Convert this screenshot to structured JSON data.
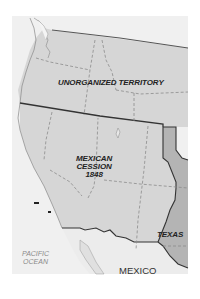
{
  "map": {
    "labels": {
      "unorganized": "UNORGANIZED TERRITORY",
      "cession_line1": "MEXICAN",
      "cession_line2": "CESSION",
      "cession_line3": "1848",
      "texas": "TEXAS",
      "ocean_line1": "PACIFIC",
      "ocean_line2": "OCEAN",
      "mexico": "MEXICO"
    },
    "colors": {
      "territory_fill": "#d6d6d6",
      "texas_fill": "#b4b4b4",
      "land_outside": "#ececec",
      "ocean": "#f2f2f2",
      "border": "#333333",
      "dashed": "#8c8c8c"
    }
  }
}
